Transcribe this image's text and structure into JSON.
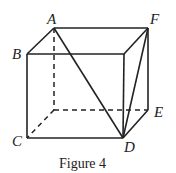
{
  "figure": {
    "caption": "Figure 4",
    "labels": {
      "A": "A",
      "B": "B",
      "C": "C",
      "D": "D",
      "E": "E",
      "F": "F"
    },
    "colors": {
      "line": "#222222",
      "background": "#ffffff"
    }
  }
}
